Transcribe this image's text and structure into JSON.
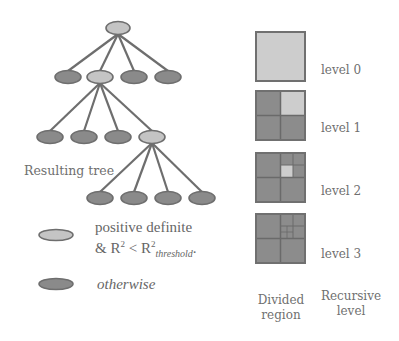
{
  "tree": {
    "caption": "Resulting tree",
    "colors": {
      "light_fill": "#c4c4c4",
      "dark_fill": "#8a8a8a",
      "stroke": "#6e6e6e",
      "edge": "#6e6e6e"
    }
  },
  "legend": {
    "items": [
      {
        "style": "light",
        "line1": "positive definite",
        "line2_prefix": "& R",
        "line2_sup1": "2",
        "line2_mid": " < R",
        "line2_sup2": "2",
        "line2_sub": "threshold",
        "line2_suffix": "."
      },
      {
        "style": "dark",
        "label": "otherwise"
      }
    ]
  },
  "regions": {
    "levels": [
      {
        "label": "level 0"
      },
      {
        "label": "level 1"
      },
      {
        "label": "level 2"
      },
      {
        "label": "level 3"
      }
    ],
    "colors": {
      "light": "#cdcdcd",
      "dark": "#8c8c8c",
      "border": "#707070"
    },
    "col_caption_left_1": "Divided",
    "col_caption_left_2": "region",
    "col_caption_right_1": "Recursive",
    "col_caption_right_2": "level"
  }
}
